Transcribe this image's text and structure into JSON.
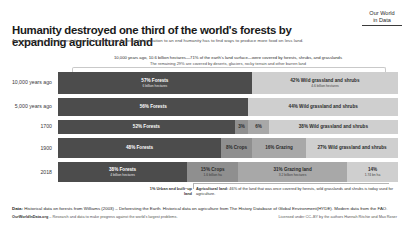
{
  "header": {
    "title": "Humanity destroyed one third of the world's forests by expanding agricultural land",
    "subtitle": "Agriculture is by far the largest drivers of deforestation. To bring deforestation to an end humanity has to find ways to produce more food on less land.",
    "logo_line1": "Our World",
    "logo_line2": "in Data"
  },
  "annotation": {
    "line1": "10,000 years ago, 10.6 billion hectares—71% of the earth's land surface—were covered by forests, shrubs, and grasslands",
    "line2": "The remaining 29% are covered by deserts, glaciers, rocky terrain and other barren land"
  },
  "footnote": {
    "urban_label": "1% Urban and built–up land",
    "agri_bold": "Agricultural land:",
    "agri_text": " 46% of the land that was once covered by forests, wild grasslands and shrubs is today used for agriculture."
  },
  "source": {
    "data_bold": "Data:",
    "data_text": " Historical data on forests from Williams (2003) – Deforesting the Earth. Historical data on agriculture from The History Database of Global Environment(HYDE). Modern data from the FAO.",
    "credit_site": "OurWorldInData.org",
    "credit_tagline": " – Research and data to make progress against the world's largest problems.",
    "license": "Licensed under CC–BY by the authors Hannah Ritchie and Max Roser"
  },
  "chart_data": {
    "type": "bar",
    "subtype": "stacked-horizontal-100",
    "title": "Humanity destroyed one third of the world's forests by expanding agricultural land",
    "xlabel": "",
    "ylabel": "",
    "xlim": [
      0,
      100
    ],
    "grid": false,
    "legend": "none",
    "categories": [
      "10,000 years ago",
      "5,000 years ago",
      "1700",
      "1900",
      "2018"
    ],
    "series": [
      {
        "name": "Forests",
        "color": "#4c4c4c",
        "values": [
          57,
          56,
          52,
          48,
          38
        ]
      },
      {
        "name": "Crops",
        "color": "#8f8f8f",
        "values": [
          0,
          0,
          3,
          8,
          15
        ]
      },
      {
        "name": "Grazing land",
        "color": "#c2c2c2",
        "values": [
          0,
          0,
          6,
          16,
          31
        ]
      },
      {
        "name": "Urban and built-up land",
        "color": "#9a9a9a",
        "values": [
          0,
          0,
          0,
          0,
          1
        ]
      },
      {
        "name": "Wild grassland and shrubs",
        "color": "#cfcfcf",
        "values": [
          42,
          44,
          38,
          27,
          14
        ]
      }
    ],
    "rows": [
      {
        "label": "10,000 years ago",
        "segments": [
          {
            "name": "forests",
            "pct": 57,
            "pct_label": "57% Forests",
            "sub": "6 billion hectares",
            "tone": "dark"
          },
          {
            "name": "wild",
            "pct": 43,
            "pct_label": "42% Wild grassland and shrubs",
            "sub": "4.6 billion hectares",
            "tone": "light"
          }
        ]
      },
      {
        "label": "5,000 years ago",
        "segments": [
          {
            "name": "forests",
            "pct": 56,
            "pct_label": "56% Forests",
            "sub": "",
            "tone": "dark"
          },
          {
            "name": "wild",
            "pct": 44,
            "pct_label": "44% Wild grassland and shrubs",
            "sub": "",
            "tone": "light"
          }
        ]
      },
      {
        "label": "1700",
        "segments": [
          {
            "name": "forests",
            "pct": 52,
            "pct_label": "52% Forests",
            "sub": "",
            "tone": "dark"
          },
          {
            "name": "crops",
            "pct": 4,
            "pct_label": "3%",
            "sub": "",
            "tone": "urban"
          },
          {
            "name": "grazing",
            "pct": 6,
            "pct_label": "6%",
            "sub": "",
            "tone": "mid"
          },
          {
            "name": "wild",
            "pct": 38,
            "pct_label": "38% Wild grassland and shrubs",
            "sub": "",
            "tone": "light"
          }
        ]
      },
      {
        "label": "1900",
        "segments": [
          {
            "name": "forests",
            "pct": 48,
            "pct_label": "48% Forests",
            "sub": "",
            "tone": "dark"
          },
          {
            "name": "crops",
            "pct": 9,
            "pct_label": "8% Crops",
            "sub": "",
            "tone": "urban"
          },
          {
            "name": "grazing",
            "pct": 16,
            "pct_label": "16% Grazing",
            "sub": "",
            "tone": "mid"
          },
          {
            "name": "wild",
            "pct": 27,
            "pct_label": "27% Wild grassland and shrubs",
            "sub": "",
            "tone": "light"
          }
        ]
      },
      {
        "label": "2018",
        "segments": [
          {
            "name": "forests",
            "pct": 38,
            "pct_label": "38% Forests",
            "sub": "4 billion hectares",
            "tone": "dark"
          },
          {
            "name": "crops",
            "pct": 15,
            "pct_label": "15% Crops",
            "sub": "1.6 billion ha",
            "tone": "urban"
          },
          {
            "name": "grazing",
            "pct": 32,
            "pct_label": "31% Grazing land",
            "sub": "3.2 billion hectares",
            "tone": "mid"
          },
          {
            "name": "wild",
            "pct": 15,
            "pct_label": "14%",
            "sub": "1.74 bn ha",
            "tone": "light"
          }
        ]
      }
    ]
  }
}
